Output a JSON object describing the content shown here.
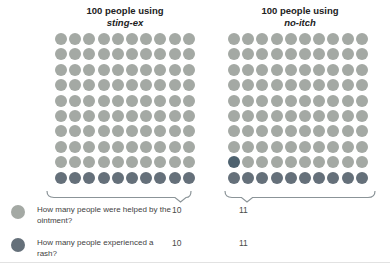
{
  "chart_data": {
    "type": "table",
    "title": "",
    "unit": "1 dot = 1 person",
    "group_titles": [
      "100 people using sting-ex",
      "100 people using no-itch"
    ],
    "total_per_group": 100,
    "shaded_dots": {
      "sting-ex": 10,
      "no-itch": 11
    },
    "columns": [
      "Question",
      "sting-ex",
      "no-itch"
    ],
    "rows": [
      [
        "How many people were helped by the ointment?",
        10,
        11
      ],
      [
        "How many people experienced a rash?",
        10,
        11
      ]
    ],
    "legend_position": "bottom",
    "grid": "off"
  },
  "colors": {
    "person": "#a4a9a4",
    "shaded": "#65707a",
    "shaded_accent": "#4e626f",
    "brace": "#8b9498",
    "title_text": "#222222",
    "question_text": "#3f3f3f",
    "answer_text": "#4a4a4a",
    "bottom_rule": "#e2e2e2"
  },
  "groups": [
    {
      "title_line1": "100 people using",
      "name_italic": "sting-ex",
      "total_people": 100,
      "shaded_count": 10
    },
    {
      "title_line1": "100 people using",
      "name_italic": "no-itch",
      "total_people": 100,
      "shaded_count": 11
    }
  ],
  "legend": {
    "questions": [
      {
        "text": "How many people were helped by the ointment?",
        "answers": [
          "10",
          "11"
        ]
      },
      {
        "text": "How many people experienced a rash?",
        "answers": [
          "10",
          "11"
        ]
      }
    ]
  }
}
